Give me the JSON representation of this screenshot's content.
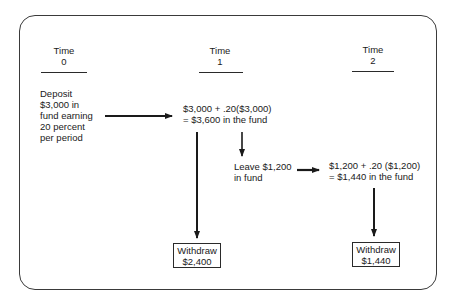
{
  "diagram": {
    "timeline": [
      {
        "label": "Time",
        "period": "0"
      },
      {
        "label": "Time",
        "period": "1"
      },
      {
        "label": "Time",
        "period": "2"
      }
    ],
    "deposit_note": {
      "lines": [
        "Deposit",
        "$3,000 in",
        "fund earning",
        "20 percent",
        "per period"
      ]
    },
    "time1_calc": {
      "lines": [
        "$3,000 + .20($3,000)",
        "= $3,600 in the fund"
      ]
    },
    "leave_note": {
      "lines": [
        "Leave $1,200",
        "in fund"
      ]
    },
    "time2_calc": {
      "lines": [
        "$1,200 + .20 ($1,200)",
        "= $1,440 in the fund"
      ]
    },
    "withdraw_boxes": [
      {
        "label": "Withdraw",
        "amount": "$2,400"
      },
      {
        "label": "Withdraw",
        "amount": "$1,440"
      }
    ],
    "arrows": [
      {
        "from": "deposit_note",
        "to": "time1_calc",
        "direction": "right"
      },
      {
        "from": "time1_calc",
        "to": "withdraw_boxes.0",
        "direction": "down"
      },
      {
        "from": "time1_calc",
        "to": "leave_note",
        "direction": "down"
      },
      {
        "from": "leave_note",
        "to": "time2_calc",
        "direction": "right"
      },
      {
        "from": "time2_calc",
        "to": "withdraw_boxes.1",
        "direction": "down"
      }
    ],
    "colors": {
      "ink": "#1a1a1a",
      "background": "#ffffff"
    }
  }
}
